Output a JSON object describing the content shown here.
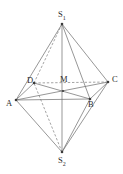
{
  "figure": {
    "type": "geometry-diagram",
    "background_color": "#ffffff",
    "solid_line_color": "#6a6a6a",
    "dashed_line_color": "#7d7d7d",
    "vertex_dot_color": "#3a3a3a",
    "label_color": "#2b2b2b",
    "vertices": {
      "S1": {
        "label": "S",
        "subscript": "1",
        "x": 62,
        "y": 24,
        "label_x": 58,
        "label_y": 10
      },
      "S2": {
        "label": "S",
        "subscript": "2",
        "x": 62,
        "y": 152,
        "label_x": 58,
        "label_y": 156
      },
      "A": {
        "label": "A",
        "subscript": "",
        "x": 16,
        "y": 100,
        "label_x": 6,
        "label_y": 99
      },
      "B": {
        "label": "B",
        "subscript": "",
        "x": 90,
        "y": 99,
        "label_x": 88,
        "label_y": 100
      },
      "C": {
        "label": "C",
        "subscript": "",
        "x": 108,
        "y": 82,
        "label_x": 112,
        "label_y": 75
      },
      "D": {
        "label": "D",
        "subscript": "",
        "x": 34,
        "y": 83,
        "label_x": 27,
        "label_y": 76
      },
      "M": {
        "label": "M",
        "subscript": "",
        "x": 63,
        "y": 91,
        "label_x": 60,
        "label_y": 75
      }
    },
    "edges": [
      {
        "name": "edge-S1-A",
        "from": "S1",
        "to": "A",
        "style": "solid"
      },
      {
        "name": "edge-S1-B",
        "from": "S1",
        "to": "B",
        "style": "solid"
      },
      {
        "name": "edge-S1-C",
        "from": "S1",
        "to": "C",
        "style": "solid"
      },
      {
        "name": "edge-S1-D",
        "from": "S1",
        "to": "D",
        "style": "dashed"
      },
      {
        "name": "edge-S2-A",
        "from": "S2",
        "to": "A",
        "style": "solid"
      },
      {
        "name": "edge-S2-B",
        "from": "S2",
        "to": "B",
        "style": "solid"
      },
      {
        "name": "edge-S2-C",
        "from": "S2",
        "to": "C",
        "style": "solid"
      },
      {
        "name": "edge-S2-D",
        "from": "S2",
        "to": "D",
        "style": "dashed"
      },
      {
        "name": "edge-A-B",
        "from": "A",
        "to": "B",
        "style": "solid"
      },
      {
        "name": "edge-B-C",
        "from": "B",
        "to": "C",
        "style": "solid"
      },
      {
        "name": "edge-C-D",
        "from": "C",
        "to": "D",
        "style": "dashed"
      },
      {
        "name": "edge-D-A",
        "from": "D",
        "to": "A",
        "style": "solid"
      },
      {
        "name": "diagonal-A-C",
        "from": "A",
        "to": "C",
        "style": "solid"
      },
      {
        "name": "diagonal-B-D",
        "from": "B",
        "to": "D",
        "style": "solid"
      },
      {
        "name": "axis-S1-S2",
        "from": "S1",
        "to": "S2",
        "style": "solid"
      }
    ]
  }
}
